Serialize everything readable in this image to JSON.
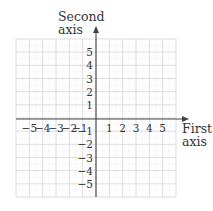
{
  "chart_data": {
    "type": "coordinate_plane",
    "title": "",
    "xlabel": "First axis",
    "ylabel": "Second axis",
    "x_label_lines": [
      "First",
      "axis"
    ],
    "y_label_lines": [
      "Second",
      "axis"
    ],
    "xlim": [
      -6,
      6
    ],
    "ylim": [
      -6,
      6
    ],
    "grid": true,
    "minor_grid": true,
    "x_ticks": [
      -5,
      -4,
      -3,
      -2,
      -1,
      1,
      2,
      3,
      4,
      5
    ],
    "y_ticks": [
      -5,
      -4,
      -3,
      -2,
      -1,
      1,
      2,
      3,
      4,
      5
    ],
    "x_tick_labels": [
      "−5",
      "−4",
      "−3",
      "−2",
      "−1",
      "1",
      "2",
      "3",
      "4",
      "5"
    ],
    "y_tick_labels": [
      "−5",
      "−4",
      "−3",
      "−2",
      "−1",
      "1",
      "2",
      "3",
      "4",
      "5"
    ],
    "points": []
  },
  "colors": {
    "grid_major": "#d4d4d4",
    "grid_minor": "#e8e8e8",
    "axis": "#444444",
    "text": "#333333"
  }
}
